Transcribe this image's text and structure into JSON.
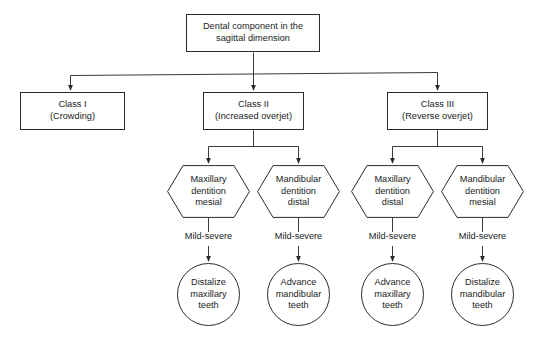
{
  "diagram": {
    "title": "Dental component in the sagittal dimension",
    "type": "flowchart",
    "background_color": "#ffffff",
    "stroke_color": "#2b2b2b",
    "text_color": "#1b1b1b"
  },
  "root": {
    "label": "Dental component in the\nsagittal dimension",
    "shape": "rectangle"
  },
  "classes": [
    {
      "label": "Class I\n(Crowding)",
      "shape": "rectangle"
    },
    {
      "label": "Class II\n(Increased overjet)",
      "shape": "rectangle"
    },
    {
      "label": "Class III\n(Reverse overjet)",
      "shape": "rectangle"
    }
  ],
  "dentitions": [
    {
      "label": "Maxillary\ndentition\nmesial",
      "shape": "hexagon"
    },
    {
      "label": "Mandibular\ndentition\ndistal",
      "shape": "hexagon"
    },
    {
      "label": "Maxillary\ndentition\ndistal",
      "shape": "hexagon"
    },
    {
      "label": "Mandibular\ndentition\nmesial",
      "shape": "hexagon"
    }
  ],
  "severity_labels": [
    {
      "label": "Mild-severe"
    },
    {
      "label": "Mild-severe"
    },
    {
      "label": "Mild-severe"
    },
    {
      "label": "Mild-severe"
    }
  ],
  "treatments": [
    {
      "label": "Distalize\nmaxillary\nteeth",
      "shape": "ellipse"
    },
    {
      "label": "Advance\nmandibular\nteeth",
      "shape": "ellipse"
    },
    {
      "label": "Advance\nmaxillary\nteeth",
      "shape": "ellipse"
    },
    {
      "label": "Distalize\nmandibular\nteeth",
      "shape": "ellipse"
    }
  ]
}
